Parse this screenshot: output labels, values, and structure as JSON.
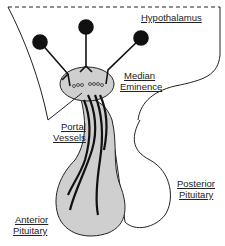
{
  "diagram": {
    "labels": {
      "hypothalamus": "Hypothalamus",
      "median_eminence_1": "Median",
      "median_eminence_2": "Eminence",
      "portal_vessels_1": "Portal",
      "portal_vessels_2": "Vessels",
      "posterior_pituitary_1": "Posterior",
      "posterior_pituitary_2": "Pituitary",
      "anterior_pituitary_1": "Anterior",
      "anterior_pituitary_2": "Pituitary"
    },
    "colors": {
      "outline": "#222222",
      "gland_fill": "#cfcfcf",
      "neuron": "#111111",
      "background": "#ffffff"
    },
    "neuron_count": 3
  }
}
